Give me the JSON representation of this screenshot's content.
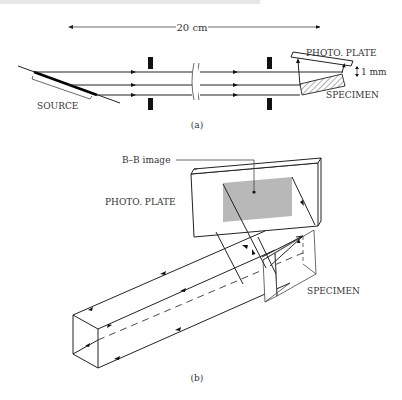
{
  "top_fragment": "... diagram of the experimental layout ...",
  "figure_a": {
    "caption": "(a)",
    "dimension_label": "20 cm",
    "labels": {
      "photo_plate": "PHOTO. PLATE",
      "gap": "1 mm",
      "specimen": "SPECIMEN",
      "source": "SOURCE"
    }
  },
  "figure_b": {
    "caption": "(b)",
    "labels": {
      "bb_image": "B–B image",
      "photo_plate": "PHOTO. PLATE",
      "specimen": "SPECIMEN"
    },
    "colors": {
      "image_fill": "#b8b8b8"
    }
  }
}
